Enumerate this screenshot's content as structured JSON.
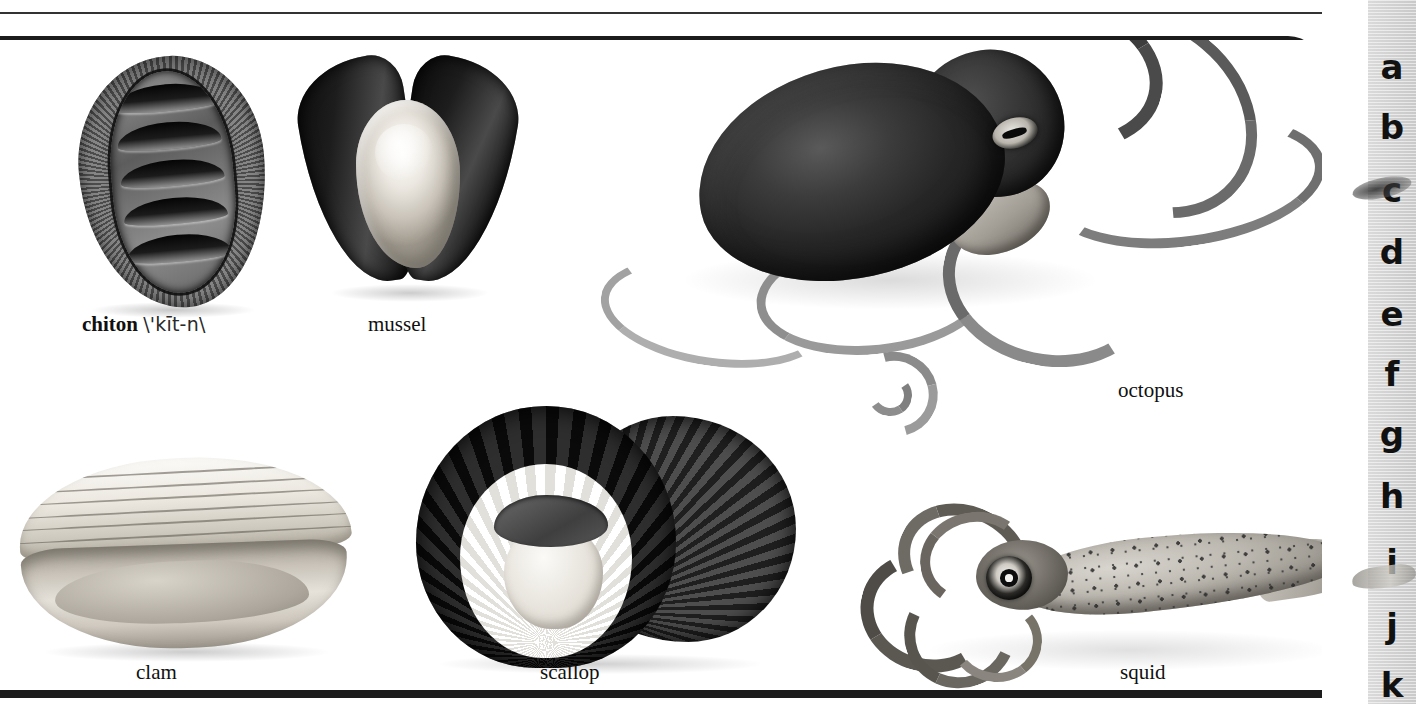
{
  "page": {
    "background_color": "#ffffff",
    "rule_color": "#1c1c1c"
  },
  "plate": {
    "figures": [
      {
        "id": "chiton",
        "label": "chiton",
        "pronunciation": "\\'kīt-n\\",
        "label_bold": true,
        "position": "top-left"
      },
      {
        "id": "mussel",
        "label": "mussel",
        "pronunciation": "",
        "label_bold": false,
        "position": "top-center-left"
      },
      {
        "id": "octopus",
        "label": "octopus",
        "pronunciation": "",
        "label_bold": false,
        "position": "top-right"
      },
      {
        "id": "clam",
        "label": "clam",
        "pronunciation": "",
        "label_bold": false,
        "position": "bottom-left"
      },
      {
        "id": "scallop",
        "label": "scallop",
        "pronunciation": "",
        "label_bold": false,
        "position": "bottom-center"
      },
      {
        "id": "squid",
        "label": "squid",
        "pronunciation": "",
        "label_bold": false,
        "position": "bottom-right"
      }
    ]
  },
  "thumb_index": {
    "background_color": "#d4d4d4",
    "text_color": "#111111",
    "letters": [
      {
        "letter": "a",
        "top": 50
      },
      {
        "letter": "b",
        "top": 110
      },
      {
        "letter": "c",
        "top": 173
      },
      {
        "letter": "d",
        "top": 235
      },
      {
        "letter": "e",
        "top": 297
      },
      {
        "letter": "f",
        "top": 357
      },
      {
        "letter": "g",
        "top": 417
      },
      {
        "letter": "h",
        "top": 479
      },
      {
        "letter": "i",
        "top": 545
      },
      {
        "letter": "j",
        "top": 609
      },
      {
        "letter": "k",
        "top": 668
      }
    ]
  }
}
